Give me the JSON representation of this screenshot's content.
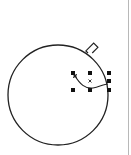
{
  "canvas": {
    "background": "#ffffff",
    "page_edge_color": "#b8b8b8",
    "stroke_color": "#222222"
  },
  "objects": {
    "ornament_circle": {
      "shape": "ellipse",
      "cx": 58,
      "cy": 95,
      "r": 50
    },
    "ornament_cap": {
      "shape": "rotated-rectangle",
      "angle_deg": -45
    },
    "selected_curve": {
      "shape": "curve",
      "selected": true
    }
  },
  "selection": {
    "handles_x": [
      73,
      90,
      109
    ],
    "handles_y": [
      73,
      81,
      90
    ],
    "center_marker": "x",
    "node_icon": "curve-node-icon"
  }
}
